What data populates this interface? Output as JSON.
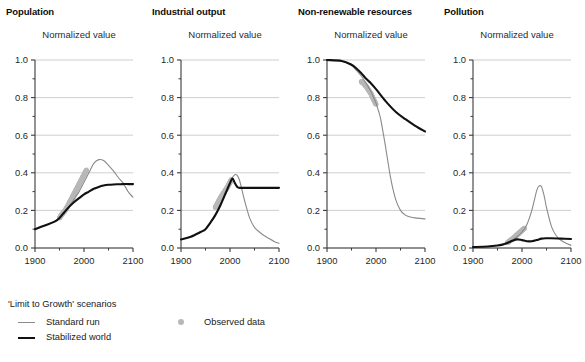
{
  "figure": {
    "subtitle_text": "Normalized value"
  },
  "panels": [
    {
      "key": "population",
      "title": "Population",
      "subtitle": "Normalized value"
    },
    {
      "key": "industrial_output",
      "title": "Industrial output",
      "subtitle": "Normalized value"
    },
    {
      "key": "nonrenewable_resources",
      "title": "Non-renewable resources",
      "subtitle": "Normalized value"
    },
    {
      "key": "pollution",
      "title": "Pollution",
      "subtitle": "Normalized value"
    }
  ],
  "axes": {
    "y_ticks": [
      "0.0",
      "0.2",
      "0.4",
      "0.6",
      "0.8",
      "1.0"
    ],
    "y_tick_values": [
      0.0,
      0.2,
      0.4,
      0.6,
      0.8,
      1.0
    ],
    "y_minor_values": [
      0.1,
      0.3,
      0.5,
      0.7,
      0.9
    ],
    "x_ticks": [
      "1900",
      "2000",
      "2100"
    ],
    "x_tick_values": [
      1900,
      2000,
      2100
    ],
    "x_minor_values": [
      1950,
      2050
    ]
  },
  "legend": {
    "title": "'Limit to Growth' scenarios",
    "items": [
      {
        "label": "Standard run",
        "marker": "thin-gray-line",
        "color": "#8a8a8a"
      },
      {
        "label": "Stabilized world",
        "marker": "thick-black-line",
        "color": "#111111"
      },
      {
        "label": "Observed data",
        "marker": "gray-dot",
        "color": "#b8b8b8"
      }
    ]
  },
  "colors": {
    "standard_run": "#8a8a8a",
    "stabilized_world": "#111111",
    "observed_data": "#b8b8b8",
    "gridline": "#c9c9c9",
    "axis": "#3a3a3a"
  },
  "chart_data": {
    "type": "line",
    "xlabel": "Year",
    "ylabel": "Normalized value",
    "xlim": [
      1900,
      2100
    ],
    "ylim": [
      0.0,
      1.0
    ],
    "grid": "horizontal",
    "legend_position": "bottom-left",
    "panels": [
      {
        "name": "Population",
        "ylabel": "Normalized value",
        "series": [
          {
            "name": "Standard run",
            "style": "thin gray line",
            "x": [
              1900,
              1920,
              1940,
              1950,
              1960,
              1970,
              1980,
              1990,
              2000,
              2010,
              2020,
              2030,
              2040,
              2050,
              2060,
              2070,
              2080,
              2090,
              2100
            ],
            "values": [
              0.1,
              0.12,
              0.14,
              0.16,
              0.19,
              0.22,
              0.26,
              0.3,
              0.35,
              0.4,
              0.45,
              0.47,
              0.465,
              0.44,
              0.41,
              0.375,
              0.345,
              0.3,
              0.27
            ]
          },
          {
            "name": "Stabilized world",
            "style": "thick black line",
            "x": [
              1900,
              1920,
              1940,
              1950,
              1960,
              1970,
              1980,
              1990,
              2000,
              2010,
              2020,
              2030,
              2040,
              2050,
              2060,
              2070,
              2080,
              2090,
              2100
            ],
            "values": [
              0.1,
              0.12,
              0.14,
              0.16,
              0.19,
              0.22,
              0.245,
              0.265,
              0.285,
              0.3,
              0.315,
              0.325,
              0.332,
              0.336,
              0.338,
              0.339,
              0.34,
              0.34,
              0.34
            ]
          },
          {
            "name": "Observed data",
            "style": "gray dot markers",
            "x": [
              1950,
              1955,
              1960,
              1965,
              1970,
              1975,
              1980,
              1985,
              1990,
              1995,
              2000,
              2005
            ],
            "values": [
              0.16,
              0.18,
              0.195,
              0.215,
              0.24,
              0.265,
              0.29,
              0.315,
              0.34,
              0.365,
              0.39,
              0.415
            ]
          }
        ]
      },
      {
        "name": "Industrial output",
        "ylabel": "Normalized value",
        "series": [
          {
            "name": "Standard run",
            "style": "thin gray line",
            "x": [
              1900,
              1920,
              1940,
              1950,
              1960,
              1970,
              1980,
              1990,
              2000,
              2005,
              2010,
              2015,
              2020,
              2030,
              2040,
              2050,
              2060,
              2070,
              2080,
              2090,
              2100
            ],
            "values": [
              0.045,
              0.06,
              0.085,
              0.1,
              0.135,
              0.175,
              0.225,
              0.28,
              0.345,
              0.375,
              0.39,
              0.385,
              0.355,
              0.25,
              0.16,
              0.11,
              0.085,
              0.065,
              0.05,
              0.035,
              0.025
            ]
          },
          {
            "name": "Stabilized world",
            "style": "thick black line",
            "x": [
              1900,
              1920,
              1940,
              1950,
              1960,
              1970,
              1980,
              1990,
              2000,
              2005,
              2010,
              2015,
              2020,
              2040,
              2060,
              2080,
              2100
            ],
            "values": [
              0.045,
              0.06,
              0.085,
              0.1,
              0.135,
              0.175,
              0.225,
              0.285,
              0.345,
              0.37,
              0.345,
              0.325,
              0.32,
              0.32,
              0.32,
              0.32,
              0.32
            ]
          },
          {
            "name": "Observed data",
            "style": "gray dot markers",
            "x": [
              1970,
              1975,
              1980,
              1985,
              1990,
              1995,
              2000,
              2003
            ],
            "values": [
              0.215,
              0.24,
              0.265,
              0.285,
              0.305,
              0.325,
              0.35,
              0.365
            ]
          }
        ]
      },
      {
        "name": "Non-renewable resources",
        "ylabel": "Normalized value",
        "series": [
          {
            "name": "Standard run",
            "style": "thin gray line",
            "x": [
              1900,
              1930,
              1950,
              1960,
              1970,
              1980,
              1990,
              2000,
              2005,
              2010,
              2020,
              2030,
              2040,
              2050,
              2060,
              2070,
              2080,
              2100
            ],
            "values": [
              1.0,
              0.995,
              0.97,
              0.945,
              0.915,
              0.875,
              0.83,
              0.77,
              0.73,
              0.68,
              0.53,
              0.37,
              0.26,
              0.2,
              0.175,
              0.165,
              0.16,
              0.155
            ]
          },
          {
            "name": "Stabilized world",
            "style": "thick black line",
            "x": [
              1900,
              1930,
              1950,
              1960,
              1970,
              1980,
              1990,
              2000,
              2020,
              2040,
              2060,
              2080,
              2100
            ],
            "values": [
              1.0,
              0.995,
              0.975,
              0.955,
              0.93,
              0.9,
              0.875,
              0.845,
              0.78,
              0.725,
              0.685,
              0.65,
              0.62
            ]
          },
          {
            "name": "Observed data",
            "style": "gray dot markers",
            "x": [
              1970,
              1975,
              1980,
              1985,
              1990,
              1995,
              2000
            ],
            "values": [
              0.885,
              0.875,
              0.86,
              0.84,
              0.82,
              0.79,
              0.765
            ]
          }
        ]
      },
      {
        "name": "Pollution",
        "ylabel": "Normalized value",
        "series": [
          {
            "name": "Standard run",
            "style": "thin gray line",
            "x": [
              1900,
              1930,
              1950,
              1960,
              1970,
              1980,
              1990,
              2000,
              2010,
              2020,
              2030,
              2035,
              2040,
              2045,
              2050,
              2060,
              2070,
              2080,
              2090,
              2100
            ],
            "values": [
              0.005,
              0.008,
              0.013,
              0.018,
              0.028,
              0.042,
              0.06,
              0.085,
              0.125,
              0.2,
              0.305,
              0.33,
              0.325,
              0.28,
              0.215,
              0.115,
              0.065,
              0.04,
              0.025,
              0.015
            ]
          },
          {
            "name": "Stabilized world",
            "style": "thick black line",
            "x": [
              1900,
              1930,
              1950,
              1960,
              1970,
              1980,
              1990,
              2000,
              2010,
              2020,
              2030,
              2040,
              2050,
              2060,
              2080,
              2100
            ],
            "values": [
              0.005,
              0.008,
              0.013,
              0.018,
              0.027,
              0.038,
              0.046,
              0.042,
              0.036,
              0.036,
              0.042,
              0.05,
              0.052,
              0.052,
              0.05,
              0.048
            ]
          },
          {
            "name": "Observed data",
            "style": "gray dot markers",
            "x": [
              1970,
              1975,
              1980,
              1985,
              1990,
              1995,
              2000,
              2005
            ],
            "values": [
              0.028,
              0.038,
              0.048,
              0.058,
              0.07,
              0.082,
              0.095,
              0.105
            ]
          }
        ]
      }
    ]
  }
}
